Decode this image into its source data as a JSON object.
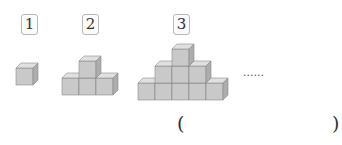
{
  "figures": [
    {
      "label": "1",
      "rows": [
        1
      ]
    },
    {
      "label": "2",
      "rows": [
        1,
        3
      ]
    },
    {
      "label": "3",
      "rows": [
        1,
        3,
        5
      ]
    }
  ],
  "continuation": "......",
  "answer_blank": {
    "open": "(",
    "close": ")",
    "value": ""
  },
  "colors": {
    "cube_front": "#c9c9c9",
    "cube_top": "#e0e0e0",
    "cube_side": "#adadad",
    "cube_edge": "#8a8a8a"
  }
}
